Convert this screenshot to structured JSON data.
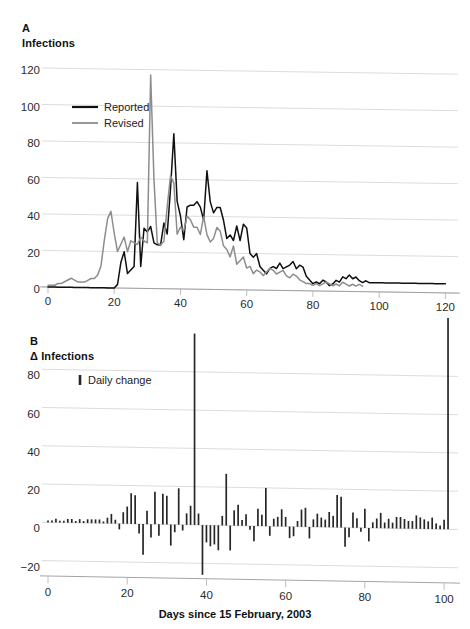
{
  "figure": {
    "panels": [
      {
        "letter": "A",
        "axis_title": "Infections"
      },
      {
        "letter": "B",
        "axis_title": "Δ Infections",
        "xlabel": "Days since 15 February, 2003"
      }
    ]
  },
  "colors": {
    "reported": "#101010",
    "revised": "#8d8d8d",
    "bar": "#262626",
    "grid": "#d8d8d8",
    "axis": "#9a9a9a",
    "background": "#ffffff"
  },
  "chart_data": [
    {
      "type": "line",
      "panel": "A",
      "title": "Infections",
      "xlabel": "",
      "ylabel": "Infections",
      "xlim": [
        0,
        122
      ],
      "ylim": [
        0,
        125
      ],
      "xticks": [
        0,
        20,
        40,
        60,
        80,
        100,
        120
      ],
      "yticks": [
        0,
        20,
        40,
        60,
        80,
        100,
        120
      ],
      "grid": true,
      "legend_position": "upper-left",
      "series": [
        {
          "name": "Reported",
          "color": "#101010",
          "x": [
            0,
            1,
            2,
            3,
            4,
            5,
            6,
            7,
            8,
            9,
            10,
            11,
            12,
            13,
            14,
            15,
            16,
            17,
            18,
            19,
            20,
            21,
            22,
            23,
            24,
            25,
            26,
            27,
            28,
            29,
            30,
            31,
            32,
            33,
            34,
            35,
            36,
            37,
            38,
            39,
            40,
            41,
            42,
            43,
            44,
            45,
            46,
            47,
            48,
            49,
            50,
            51,
            52,
            53,
            54,
            55,
            56,
            57,
            58,
            59,
            60,
            61,
            62,
            63,
            64,
            65,
            66,
            67,
            68,
            69,
            70,
            71,
            72,
            73,
            74,
            75,
            76,
            77,
            78,
            79,
            80,
            81,
            82,
            83,
            84,
            85,
            86,
            87,
            88,
            89,
            90,
            91,
            92,
            93,
            94,
            95,
            96,
            97,
            98,
            99,
            100,
            101,
            102,
            103,
            104,
            105,
            106,
            107,
            108,
            109,
            110,
            111,
            112,
            113,
            114,
            115,
            116,
            117,
            118,
            119,
            120
          ],
          "values": [
            0,
            0,
            0,
            0,
            0,
            0,
            0,
            0,
            0,
            0,
            0,
            0,
            0,
            0,
            0,
            0,
            0,
            0,
            0,
            0,
            0,
            2,
            14,
            20,
            8,
            10,
            12,
            58,
            12,
            33,
            31,
            34,
            25,
            24,
            24,
            36,
            30,
            55,
            85,
            48,
            40,
            27,
            45,
            46,
            46,
            48,
            45,
            38,
            65,
            48,
            42,
            45,
            45,
            38,
            28,
            30,
            27,
            35,
            27,
            36,
            34,
            20,
            18,
            20,
            13,
            11,
            9,
            12,
            13,
            12,
            15,
            12,
            13,
            14,
            16,
            12,
            14,
            13,
            8,
            6,
            4,
            5,
            4,
            6,
            5,
            3,
            4,
            6,
            5,
            8,
            7,
            9,
            7,
            8,
            6,
            5,
            6,
            5,
            5,
            5,
            5,
            5,
            5,
            5,
            5,
            5,
            5,
            5,
            5,
            5,
            5,
            5,
            5,
            5,
            5,
            5,
            5,
            5,
            5,
            5,
            5
          ]
        },
        {
          "name": "Revised",
          "color": "#8d8d8d",
          "x": [
            0,
            1,
            2,
            3,
            4,
            5,
            6,
            7,
            8,
            9,
            10,
            11,
            12,
            13,
            14,
            15,
            16,
            17,
            18,
            19,
            20,
            21,
            22,
            23,
            24,
            25,
            26,
            27,
            28,
            29,
            30,
            31,
            32,
            33,
            34,
            35,
            36,
            37,
            38,
            39,
            40,
            41,
            42,
            43,
            44,
            45,
            46,
            47,
            48,
            49,
            50,
            51,
            52,
            53,
            54,
            55,
            56,
            57,
            58,
            59,
            60,
            61,
            62,
            63,
            64,
            65,
            66,
            67,
            68,
            69,
            70,
            71,
            72,
            73,
            74,
            75,
            76,
            77,
            78,
            79,
            80,
            81,
            82,
            83,
            84,
            85,
            86,
            87,
            88,
            89,
            90,
            91,
            92,
            93,
            94,
            95
          ],
          "values": [
            1,
            1,
            1,
            2,
            2,
            3,
            4,
            5,
            4,
            3,
            3,
            3,
            4,
            5,
            5,
            7,
            12,
            26,
            38,
            42,
            30,
            20,
            24,
            28,
            20,
            26,
            25,
            24,
            28,
            26,
            25,
            117,
            60,
            25,
            24,
            26,
            45,
            62,
            58,
            30,
            34,
            32,
            40,
            38,
            34,
            34,
            30,
            40,
            30,
            26,
            28,
            34,
            32,
            24,
            22,
            18,
            24,
            14,
            16,
            18,
            12,
            13,
            9,
            11,
            10,
            8,
            10,
            12,
            11,
            9,
            10,
            11,
            8,
            7,
            9,
            8,
            6,
            5,
            4,
            4,
            3,
            4,
            3,
            4,
            5,
            4,
            3,
            4,
            3,
            5,
            4,
            3,
            4,
            3,
            4,
            3
          ]
        }
      ]
    },
    {
      "type": "bar",
      "panel": "B",
      "title": "Δ Infections",
      "xlabel": "Days since 15 February, 2003",
      "ylabel": "Δ Infections",
      "xlim": [
        0,
        102
      ],
      "ylim": [
        -28,
        88
      ],
      "xticks": [
        0,
        20,
        40,
        60,
        80,
        100
      ],
      "yticks": [
        -20,
        0,
        20,
        40,
        60,
        80
      ],
      "grid": true,
      "legend_label": "Daily change",
      "categories": [
        0,
        1,
        2,
        3,
        4,
        5,
        6,
        7,
        8,
        9,
        10,
        11,
        12,
        13,
        14,
        15,
        16,
        17,
        18,
        19,
        20,
        21,
        22,
        23,
        24,
        25,
        26,
        27,
        28,
        29,
        30,
        31,
        32,
        33,
        34,
        35,
        36,
        37,
        38,
        39,
        40,
        41,
        42,
        43,
        44,
        45,
        46,
        47,
        48,
        49,
        50,
        51,
        52,
        53,
        54,
        55,
        56,
        57,
        58,
        59,
        60,
        61,
        62,
        63,
        64,
        65,
        66,
        67,
        68,
        69,
        70,
        71,
        72,
        73,
        74,
        75,
        76,
        77,
        78,
        79,
        80,
        81,
        82,
        83,
        84,
        85,
        86,
        87,
        88,
        89,
        90,
        91,
        92,
        93,
        94,
        95,
        96,
        97,
        98,
        99,
        100,
        101
      ],
      "values": [
        1,
        1,
        2,
        1,
        1,
        2,
        2,
        1,
        2,
        1,
        2,
        2,
        2,
        2,
        1,
        3,
        5,
        2,
        -3,
        6,
        9,
        16,
        15,
        -5,
        -16,
        7,
        -7,
        17,
        -6,
        16,
        15,
        -11,
        -4,
        19,
        -3,
        6,
        10,
        100,
        6,
        -26,
        -9,
        -11,
        -10,
        -13,
        5,
        27,
        -13,
        8,
        11,
        3,
        6,
        -2,
        -8,
        9,
        6,
        20,
        -5,
        4,
        5,
        9,
        5,
        -6,
        -5,
        3,
        9,
        10,
        -6,
        4,
        7,
        5,
        4,
        8,
        6,
        17,
        16,
        -10,
        -5,
        8,
        5,
        -2,
        10,
        -7,
        3,
        5,
        8,
        3,
        5,
        3,
        6,
        6,
        5,
        4,
        4,
        7,
        6,
        5,
        4,
        6,
        3,
        2,
        5
      ]
    }
  ]
}
